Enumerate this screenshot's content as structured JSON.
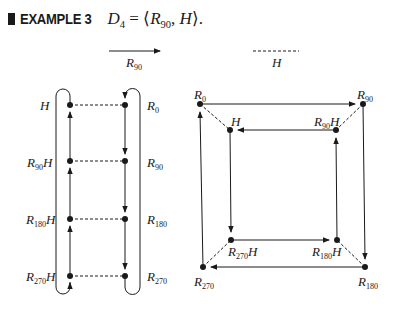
{
  "title": {
    "marker": "■",
    "example_label": "EXAMPLE 3",
    "equation": {
      "lhs": "D",
      "lhs_sub": "4",
      "equals": " = ⟨",
      "gen1": "R",
      "gen1_sub": "90",
      "sep": ", ",
      "gen2": "H",
      "close": "⟩."
    }
  },
  "legend": {
    "solid_arrow": {
      "label": "R",
      "label_sub": "90",
      "meaning": "multiply by R90"
    },
    "dashed_line": {
      "label": "H",
      "meaning": "multiply by H"
    }
  },
  "left_diagram": {
    "nodes_left": [
      {
        "label": "H",
        "sub": ""
      },
      {
        "label": "R",
        "sub": "90",
        "suffix": "H"
      },
      {
        "label": "R",
        "sub": "180",
        "suffix": "H"
      },
      {
        "label": "R",
        "sub": "270",
        "suffix": "H"
      }
    ],
    "nodes_right": [
      {
        "label": "R",
        "sub": "0"
      },
      {
        "label": "R",
        "sub": "90"
      },
      {
        "label": "R",
        "sub": "180"
      },
      {
        "label": "R",
        "sub": "270"
      }
    ]
  },
  "right_diagram": {
    "outer": {
      "top_left": {
        "label": "R",
        "sub": "0"
      },
      "top_right": {
        "label": "R",
        "sub": "90"
      },
      "bottom_right": {
        "label": "R",
        "sub": "180"
      },
      "bottom_left": {
        "label": "R",
        "sub": "270"
      }
    },
    "inner": {
      "top_left": {
        "label": "H",
        "sub": ""
      },
      "top_right": {
        "label": "R",
        "sub": "90",
        "suffix": "H"
      },
      "bottom_right": {
        "label": "R",
        "sub": "180",
        "suffix": "H"
      },
      "bottom_left": {
        "label": "R",
        "sub": "270",
        "suffix": "H"
      }
    }
  }
}
